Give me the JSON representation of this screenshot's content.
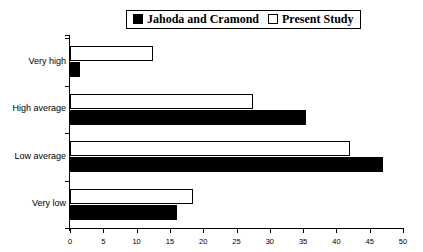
{
  "legend": {
    "position": "top-center",
    "entries": [
      {
        "label": "Jahoda and Cramond",
        "swatch": "black",
        "color": "#000000"
      },
      {
        "label": "Present Study",
        "swatch": "white",
        "color": "#ffffff"
      }
    ]
  },
  "chart_data": {
    "type": "bar",
    "orientation": "horizontal",
    "title": "",
    "xlabel": "",
    "ylabel": "",
    "categories": [
      "Very high",
      "High average",
      "Low average",
      "Very low"
    ],
    "series": [
      {
        "name": "Jahoda and Cramond",
        "color": "#000000",
        "values": [
          1.5,
          35.5,
          47,
          16
        ]
      },
      {
        "name": "Present Study",
        "color": "#ffffff",
        "values": [
          12.5,
          27.5,
          42,
          18.5
        ]
      }
    ],
    "xlim": [
      0,
      50
    ],
    "xticks": [
      0,
      5,
      10,
      15,
      20,
      25,
      30,
      35,
      40,
      45,
      50
    ],
    "xticklabels": [
      "0",
      "5",
      "10",
      "15",
      "20",
      "25",
      "30",
      "35",
      "40",
      "45",
      "50"
    ],
    "grid": false,
    "legend_position": "top-center"
  }
}
